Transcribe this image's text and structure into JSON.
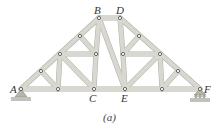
{
  "figure": {
    "caption": "(a)",
    "type": "roof truss",
    "colors": {
      "member": "#d8d8d0",
      "member_edge": "#b0b0a8",
      "pin": "#555555",
      "label": "#333333",
      "support": "#b5b5ab"
    }
  },
  "labels": {
    "A": "A",
    "B": "B",
    "C": "C",
    "D": "D",
    "E": "E",
    "F": "F"
  },
  "supports": {
    "left": "pin-support-A",
    "right": "roller-support-F"
  }
}
